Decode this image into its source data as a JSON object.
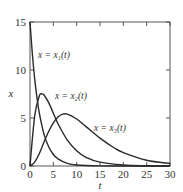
{
  "chart_data": {
    "type": "line",
    "title": "",
    "xlabel": "t",
    "ylabel": "x",
    "xlim": [
      0,
      30
    ],
    "ylim": [
      0,
      15
    ],
    "xticks": [
      0,
      5,
      10,
      15,
      20,
      25,
      30
    ],
    "yticks": [
      0,
      5,
      10,
      15
    ],
    "grid": false,
    "legend": "inline curve labels",
    "series": [
      {
        "name": "x = x1(t)",
        "label": "x = x₁(t)",
        "x": [
          0,
          0.5,
          1,
          1.5,
          2,
          3,
          4,
          5,
          6,
          8,
          10,
          15,
          20,
          30
        ],
        "y": [
          15,
          11.7,
          9.1,
          7.1,
          5.5,
          3.3,
          2.0,
          1.2,
          0.75,
          0.27,
          0.1,
          0.01,
          0,
          0
        ]
      },
      {
        "name": "x = x2(t)",
        "label": "x = x₂(t)",
        "x": [
          0,
          1,
          2,
          2.5,
          3,
          4,
          5,
          6,
          8,
          10,
          12,
          15,
          20,
          25,
          30
        ],
        "y": [
          0,
          5.2,
          7.3,
          7.5,
          7.4,
          6.6,
          5.5,
          4.4,
          2.7,
          1.6,
          0.9,
          0.4,
          0.1,
          0.02,
          0
        ]
      },
      {
        "name": "x = x3(t)",
        "label": "x = x₃(t)",
        "x": [
          0,
          1,
          2,
          3,
          4,
          5,
          6,
          7,
          8,
          10,
          12,
          15,
          18,
          20,
          25,
          30
        ],
        "y": [
          0,
          0.4,
          1.3,
          2.5,
          3.6,
          4.5,
          5.1,
          5.4,
          5.4,
          4.9,
          4.1,
          2.9,
          1.9,
          1.4,
          0.6,
          0.25
        ]
      }
    ],
    "annotations": [
      {
        "text": "x = x₁(t)",
        "at": [
          5,
          12
        ]
      },
      {
        "text": "x = x₂(t)",
        "at": [
          5,
          8.5
        ]
      },
      {
        "text": "x = x₃(t)",
        "at": [
          19,
          5.3
        ]
      }
    ]
  },
  "labels": {
    "xlabel": "t",
    "ylabel": "x",
    "x1": "x = x₁(t)",
    "x2": "x = x₂(t)",
    "x3": "x = x₃(t)",
    "xticks": [
      "0",
      "5",
      "10",
      "15",
      "20",
      "25",
      "30"
    ],
    "yticks": [
      "0",
      "5",
      "10",
      "15"
    ]
  }
}
